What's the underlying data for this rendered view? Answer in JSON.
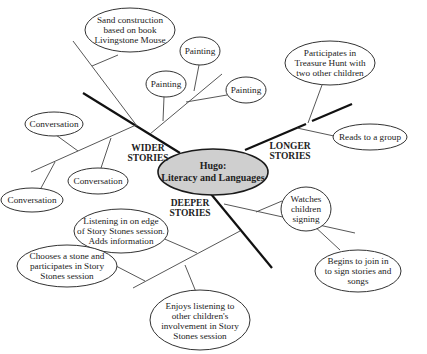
{
  "diagram": {
    "type": "mind-map",
    "center": {
      "lines": [
        "Hugo:",
        "Literacy and Languages"
      ]
    },
    "branches": [
      {
        "label": [
          "WIDER",
          "STORIES"
        ],
        "nodes": [
          {
            "lines": [
              "Sand construction",
              "based on book",
              "Livingstone Mouse"
            ]
          },
          {
            "lines": [
              "Painting"
            ]
          },
          {
            "lines": [
              "Painting"
            ]
          },
          {
            "lines": [
              "Painting"
            ]
          },
          {
            "lines": [
              "Conversation"
            ]
          },
          {
            "lines": [
              "Conversation"
            ]
          },
          {
            "lines": [
              "Conversation"
            ]
          }
        ]
      },
      {
        "label": [
          "LONGER",
          "STORIES"
        ],
        "nodes": [
          {
            "lines": [
              "Participates in",
              "Treasure Hunt with",
              "two other children"
            ]
          },
          {
            "lines": [
              "Reads to a group"
            ]
          }
        ]
      },
      {
        "label": [
          "DEEPER",
          "STORIES"
        ],
        "nodes": [
          {
            "lines": [
              "Watches",
              "children",
              "signing"
            ]
          },
          {
            "lines": [
              "Begins to join in",
              "to sign stories and",
              "songs"
            ]
          },
          {
            "lines": [
              "Listening in on edge",
              "of Story Stones session.",
              "Adds information"
            ]
          },
          {
            "lines": [
              "Chooses a stone and",
              "participates in Story",
              "Stones session"
            ]
          },
          {
            "lines": [
              "Enjoys listening to",
              "other children's",
              "involvement in Story",
              "Stones session"
            ]
          }
        ]
      }
    ],
    "colors": {
      "center_fill": "#cfcfcf",
      "line": "#111111",
      "node_fill": "#ffffff"
    }
  }
}
